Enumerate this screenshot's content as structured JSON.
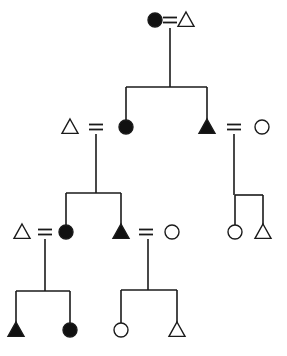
{
  "diagram": {
    "type": "kinship-chart",
    "colors": {
      "stroke": "#1a1a1a",
      "fill": "#111111",
      "background": "#ffffff"
    },
    "legend_semantics": {
      "triangle": "male",
      "circle": "female",
      "filled": "ego-line / highlighted",
      "equals": "marriage"
    },
    "nodes": [
      {
        "id": "g1_wife",
        "shape": "circle",
        "filled": true,
        "x": 155,
        "y": 20
      },
      {
        "id": "g1_husband",
        "shape": "triangle",
        "filled": false,
        "x": 186,
        "y": 20
      },
      {
        "id": "g2_husband_left",
        "shape": "triangle",
        "filled": false,
        "x": 70,
        "y": 127
      },
      {
        "id": "g2_daughter",
        "shape": "circle",
        "filled": true,
        "x": 126,
        "y": 127
      },
      {
        "id": "g2_son",
        "shape": "triangle",
        "filled": true,
        "x": 207,
        "y": 127
      },
      {
        "id": "g2_son_wife",
        "shape": "circle",
        "filled": false,
        "x": 262,
        "y": 127
      },
      {
        "id": "g3_husband_left",
        "shape": "triangle",
        "filled": false,
        "x": 22,
        "y": 232
      },
      {
        "id": "g3_daughter",
        "shape": "circle",
        "filled": true,
        "x": 66,
        "y": 232
      },
      {
        "id": "g3_son",
        "shape": "triangle",
        "filled": true,
        "x": 121,
        "y": 232
      },
      {
        "id": "g3_son_wife",
        "shape": "circle",
        "filled": false,
        "x": 172,
        "y": 232
      },
      {
        "id": "g4_son_left",
        "shape": "triangle",
        "filled": true,
        "x": 16,
        "y": 330
      },
      {
        "id": "g4_daughter_left",
        "shape": "circle",
        "filled": true,
        "x": 70,
        "y": 330
      },
      {
        "id": "g2_son_child_f",
        "shape": "circle",
        "filled": false,
        "x": 235,
        "y": 232
      },
      {
        "id": "g2_son_child_m",
        "shape": "triangle",
        "filled": false,
        "x": 263,
        "y": 232
      },
      {
        "id": "g4_daughter_right",
        "shape": "circle",
        "filled": false,
        "x": 121,
        "y": 330
      },
      {
        "id": "g4_son_right",
        "shape": "triangle",
        "filled": false,
        "x": 177,
        "y": 330
      }
    ],
    "marriages": [
      {
        "x": 170,
        "y": 20
      },
      {
        "x": 96,
        "y": 127
      },
      {
        "x": 234,
        "y": 127
      },
      {
        "x": 45,
        "y": 232
      },
      {
        "x": 146,
        "y": 232
      }
    ],
    "caption": ""
  }
}
